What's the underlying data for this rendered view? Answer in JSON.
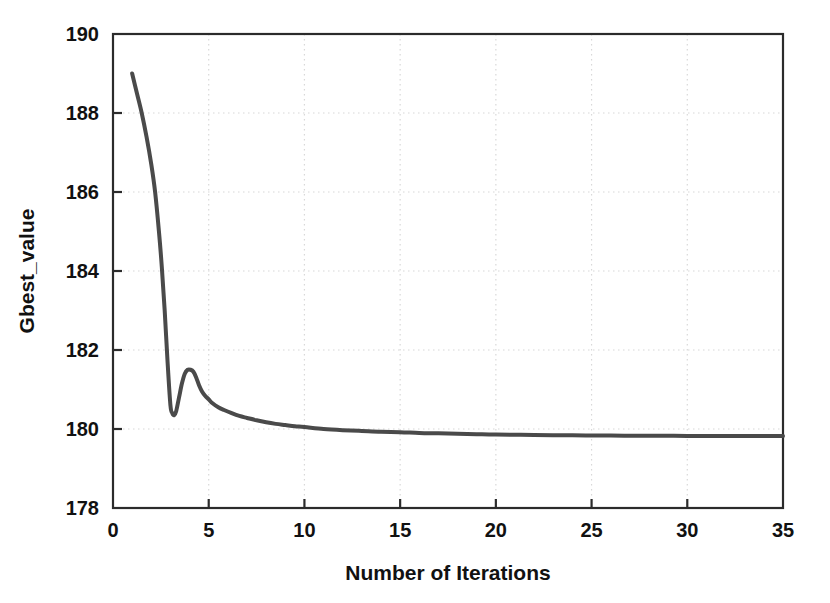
{
  "chart_data": {
    "type": "line",
    "title": "",
    "xlabel": "Number of Iterations",
    "ylabel": "Gbest_value",
    "xlim": [
      0,
      35
    ],
    "ylim": [
      178,
      190
    ],
    "xticks": [
      0,
      5,
      10,
      15,
      20,
      25,
      30,
      35
    ],
    "xtick_labels": [
      "0",
      "5",
      "10",
      "15",
      "20",
      "25",
      "30",
      "35"
    ],
    "yticks": [
      178,
      180,
      182,
      184,
      186,
      188,
      190
    ],
    "ytick_labels": [
      "178",
      "180",
      "182",
      "184",
      "186",
      "188",
      "190"
    ],
    "grid": true,
    "grid_style": "dotted",
    "legend": null,
    "line_color": "#4a4a4a",
    "line_width": 4,
    "series": [
      {
        "name": "Gbest_value",
        "x": [
          1.0,
          1.25,
          1.5,
          1.75,
          2.0,
          2.2,
          2.4,
          2.55,
          2.7,
          2.85,
          3.0,
          3.1,
          3.2,
          3.3,
          3.45,
          3.6,
          3.75,
          3.9,
          4.05,
          4.2,
          4.35,
          4.5,
          4.65,
          4.8,
          5.0,
          5.2,
          5.5,
          5.8,
          6.2,
          6.6,
          7.0,
          7.5,
          8.0,
          8.5,
          9.0,
          9.5,
          10.0,
          11.0,
          12.0,
          13.0,
          14.0,
          15.0,
          16.0,
          17.0,
          18.0,
          19.0,
          20.0,
          22.0,
          24.0,
          26.0,
          27.0,
          28.0,
          30.0,
          32.0,
          35.0
        ],
        "y": [
          189.0,
          188.5,
          188.0,
          187.4,
          186.7,
          186.0,
          185.0,
          184.1,
          183.0,
          181.7,
          180.6,
          180.4,
          180.35,
          180.45,
          180.8,
          181.15,
          181.4,
          181.5,
          181.5,
          181.45,
          181.3,
          181.1,
          180.95,
          180.85,
          180.75,
          180.65,
          180.55,
          180.48,
          180.4,
          180.33,
          180.28,
          180.22,
          180.17,
          180.13,
          180.1,
          180.07,
          180.05,
          180.0,
          179.97,
          179.95,
          179.93,
          179.92,
          179.9,
          179.89,
          179.88,
          179.87,
          179.86,
          179.85,
          179.84,
          179.835,
          179.83,
          179.83,
          179.825,
          179.82,
          179.82
        ]
      }
    ]
  },
  "axes": {
    "x_title": "Number of Iterations",
    "y_title": "Gbest_value"
  }
}
